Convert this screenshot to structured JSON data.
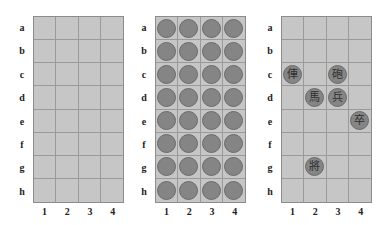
{
  "rows": [
    "a",
    "b",
    "c",
    "d",
    "e",
    "f",
    "g",
    "h"
  ],
  "cols": [
    "1",
    "2",
    "3",
    "4"
  ],
  "colors": {
    "board": "#c6c6c6",
    "grid": "#9a9a9a",
    "disc": "#858585",
    "disc_border": "#6a6a6a"
  },
  "boards": [
    {
      "name": "empty-board",
      "description": "Empty 4x8 board",
      "pieces": []
    },
    {
      "name": "face-down-board",
      "description": "All 32 squares covered by face-down discs",
      "pieces": "all-face-down"
    },
    {
      "name": "game-position-board",
      "description": "Revealed pieces on board",
      "pieces": [
        {
          "square": "c1",
          "row": "c",
          "col": "1",
          "char": "俥"
        },
        {
          "square": "c3",
          "row": "c",
          "col": "3",
          "char": "砲"
        },
        {
          "square": "d2",
          "row": "d",
          "col": "2",
          "char": "馬"
        },
        {
          "square": "d3",
          "row": "d",
          "col": "3",
          "char": "兵"
        },
        {
          "square": "e4",
          "row": "e",
          "col": "4",
          "char": "卒"
        },
        {
          "square": "g2",
          "row": "g",
          "col": "2",
          "char": "將"
        }
      ]
    }
  ]
}
